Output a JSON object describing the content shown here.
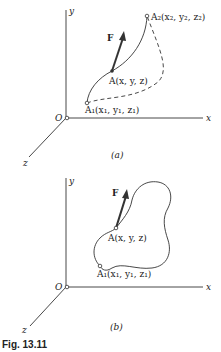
{
  "figure": {
    "caption": "Fig. 13.11",
    "panels": [
      {
        "id": "a",
        "label": "(a)",
        "axes": {
          "origin": "O",
          "x": "x",
          "y": "y",
          "z": "z"
        },
        "force_label": "F",
        "points": {
          "A2": "A₂(x₂, y₂, z₂)",
          "A": "A(x, y, z)",
          "A1": "A₁(x₁, y₁, z₁)"
        },
        "paths": [
          "solid curve A1 to A2 through A",
          "dashed curve A1 to A2"
        ]
      },
      {
        "id": "b",
        "label": "(b)",
        "axes": {
          "origin": "O",
          "x": "x",
          "y": "y",
          "z": "z"
        },
        "force_label": "F",
        "points": {
          "A": "A(x, y, z)",
          "A1": "A₁(x₁, y₁, z₁)"
        },
        "paths": [
          "closed loop through A1 and A"
        ]
      }
    ]
  },
  "colors": {
    "ink": "#222222",
    "background": "#ffffff"
  }
}
